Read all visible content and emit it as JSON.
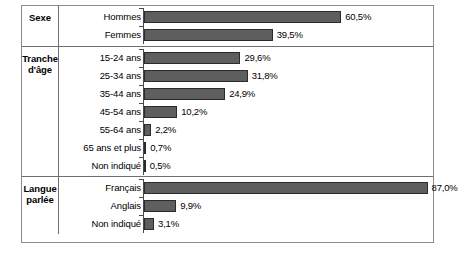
{
  "chart_data": {
    "type": "bar",
    "title": "",
    "xlabel": "",
    "ylabel": "",
    "orientation": "horizontal",
    "xlim": [
      0,
      90
    ],
    "grid": false,
    "legend": false,
    "value_suffix": "%",
    "decimal_separator": ",",
    "colors": {
      "bar_fill": "#5e5e5e",
      "bar_outline": "#2b2b2b",
      "frame": "#8a8a8a",
      "divider": "#6f6f6f",
      "axis": "#4a4a4a",
      "background": "#ffffff",
      "text": "#000000"
    },
    "sections": [
      {
        "label": "Sexe",
        "label_lines": [
          "Sexe"
        ],
        "categories": [
          "Hommes",
          "Femmes"
        ],
        "values": [
          60.5,
          39.5
        ],
        "value_labels": [
          "60,5%",
          "39,5%"
        ]
      },
      {
        "label": "Tranche d'âge",
        "label_lines": [
          "Tranche",
          "d'âge"
        ],
        "categories": [
          "15-24 ans",
          "25-34 ans",
          "35-44 ans",
          "45-54 ans",
          "55-64 ans",
          "65 ans et plus",
          "Non indiqué"
        ],
        "values": [
          29.6,
          31.8,
          24.9,
          10.2,
          2.2,
          0.7,
          0.5
        ],
        "value_labels": [
          "29,6%",
          "31,8%",
          "24,9%",
          "10,2%",
          "2,2%",
          "0,7%",
          "0,5%"
        ]
      },
      {
        "label": "Langue parlée",
        "label_lines": [
          "Langue",
          "parlée"
        ],
        "categories": [
          "Français",
          "Anglais",
          "Non indiqué"
        ],
        "values": [
          87.0,
          9.9,
          3.1
        ],
        "value_labels": [
          "87,0%",
          "9,9%",
          "3,1%"
        ]
      }
    ]
  }
}
